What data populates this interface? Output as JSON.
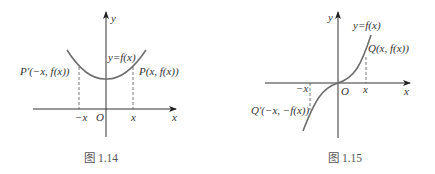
{
  "figures": [
    {
      "id": "fig-1-14",
      "caption": "图 1.14",
      "axis_labels": {
        "x": "x",
        "y": "y",
        "origin": "O"
      },
      "tick_labels": {
        "neg_x": "−x",
        "pos_x": "x"
      },
      "curve_label": "y=f(x)",
      "points": [
        {
          "name": "P'",
          "label": "P′(−x, f(x))"
        },
        {
          "name": "P",
          "label": "P(x, f(x))"
        }
      ],
      "description": "Even function: parabola-like curve symmetric about the y-axis"
    },
    {
      "id": "fig-1-15",
      "caption": "图 1.15",
      "axis_labels": {
        "x": "x",
        "y": "y",
        "origin": "O"
      },
      "tick_labels": {
        "neg_x": "−x",
        "pos_x": "x"
      },
      "curve_label": "y=f(x)",
      "points": [
        {
          "name": "Q",
          "label": "Q(x, f(x))"
        },
        {
          "name": "Q'",
          "label": "Q′(−x, −f(x))"
        }
      ],
      "description": "Odd function: cubic-like curve symmetric about the origin"
    }
  ],
  "colors": {
    "axis": "#333333",
    "curve": "#6e6e6e",
    "dashed": "#555555",
    "caption": "#555555"
  }
}
